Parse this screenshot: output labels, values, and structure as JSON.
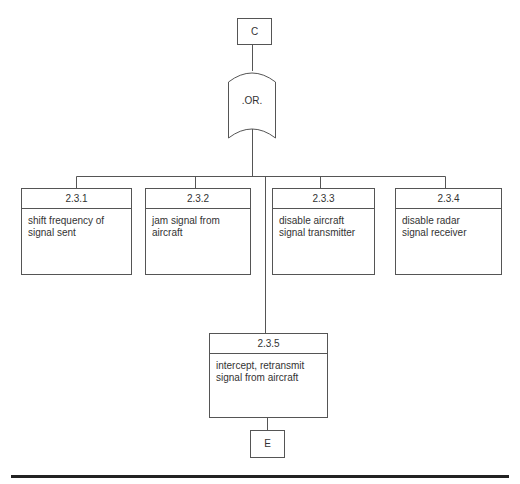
{
  "diagram": {
    "type": "fault-tree",
    "top_connector": {
      "label": "C"
    },
    "gate": {
      "type": "OR",
      "label": ".OR."
    },
    "children": [
      {
        "id": "2.3.1",
        "text": [
          "shift frequency of",
          "signal sent"
        ]
      },
      {
        "id": "2.3.2",
        "text": [
          "jam signal from",
          "aircraft"
        ]
      },
      {
        "id": "2.3.3",
        "text": [
          "disable aircraft",
          "signal transmitter"
        ]
      },
      {
        "id": "2.3.4",
        "text": [
          "disable radar",
          "signal receiver"
        ]
      },
      {
        "id": "2.3.5",
        "text": [
          "intercept, retransmit",
          "signal from aircraft"
        ]
      }
    ],
    "bottom_connector": {
      "label": "E"
    }
  },
  "colors": {
    "line": "#555555",
    "text": "#333333",
    "rule": "#222222",
    "background": "#ffffff"
  }
}
